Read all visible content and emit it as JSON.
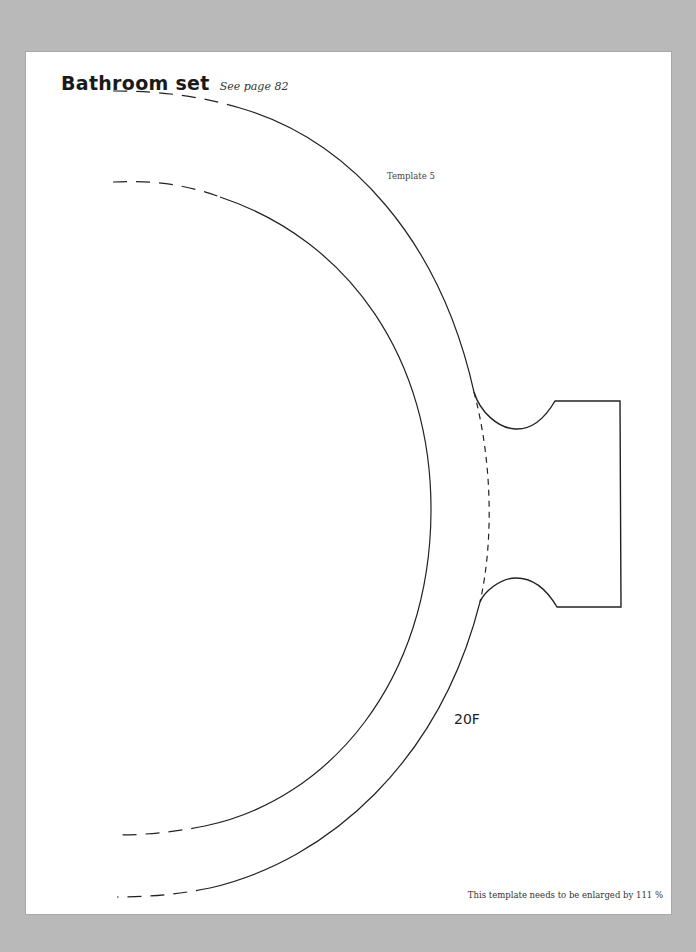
{
  "header": {
    "title": "Bathroom set",
    "subtitle": "See page 82"
  },
  "template": {
    "label": "Template 5",
    "piece_code": "20F"
  },
  "footer": {
    "note": "This template needs to be enlarged by 111 %"
  },
  "colors": {
    "background": "#b9b9b9",
    "page": "#ffffff",
    "line": "#222222"
  }
}
